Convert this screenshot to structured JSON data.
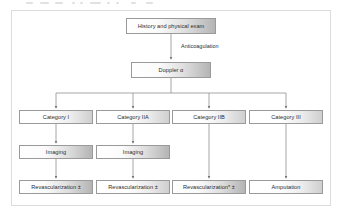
{
  "figure": {
    "type": "clinical-algorithm-flowchart",
    "title_visible": false,
    "frame_border_color": "#dcdcdc",
    "node_border_color": "#9a9a9a",
    "connector_color": "#8f8f8f",
    "text_color": "#2b2b2b",
    "background": "#ffffff"
  },
  "nodes": {
    "history": {
      "label": "History and physical exam"
    },
    "doppler": {
      "label": "Doppler α"
    },
    "category_i": {
      "label": "Category I"
    },
    "category_iia": {
      "label": "Category IIA"
    },
    "category_iib": {
      "label": "Category IIB"
    },
    "category_iii": {
      "label": "Category III"
    },
    "imaging_1": {
      "label": "Imaging"
    },
    "imaging_2": {
      "label": "Imaging"
    },
    "revasc_1": {
      "label": "Revascularization ±"
    },
    "revasc_2": {
      "label": "Revascularization ±"
    },
    "revasc_3": {
      "label": "Revascularization* ±"
    },
    "amputation": {
      "label": "Amputation"
    }
  },
  "edge_labels": {
    "anticoagulation": "Anticoagulation"
  }
}
